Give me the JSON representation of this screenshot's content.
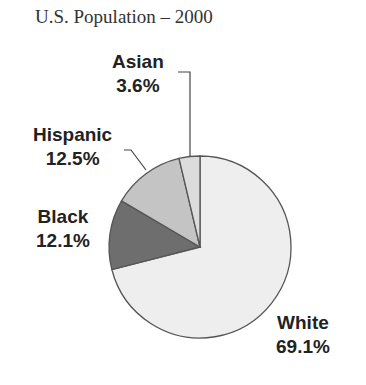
{
  "chart_data": {
    "type": "pie",
    "title": "U.S. Population – 2000",
    "categories": [
      "White",
      "Black",
      "Hispanic",
      "Asian"
    ],
    "values": [
      69.1,
      12.1,
      12.5,
      3.6
    ],
    "labels": [
      "69.1%",
      "12.1%",
      "12.5%",
      "3.6%"
    ],
    "colors": [
      "#eeeeee",
      "#6e6e6e",
      "#c4c4c4",
      "#dcdcdc"
    ],
    "legend": "none (direct labels)",
    "start_angle_deg": 0,
    "direction": "clockwise from top"
  },
  "labels": {
    "white": {
      "name": "White",
      "pct": "69.1%"
    },
    "black": {
      "name": "Black",
      "pct": "12.1%"
    },
    "hispanic": {
      "name": "Hispanic",
      "pct": "12.5%"
    },
    "asian": {
      "name": "Asian",
      "pct": "3.6%"
    }
  }
}
